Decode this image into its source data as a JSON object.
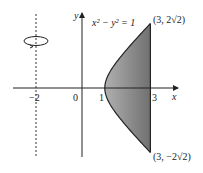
{
  "diagram": {
    "equation_label": "x² − y² = 1",
    "axis_labels": {
      "x": "x",
      "y": "y"
    },
    "ticks": {
      "neg2": "−2",
      "zero": "0",
      "one": "1",
      "three": "3"
    },
    "point_top": "(3, 2√2)",
    "point_bottom": "(3, −2√2)",
    "rotation_axis": "x = −2",
    "region": "between hyperbola x² − y² = 1 and line x = 3",
    "colors": {
      "fill": "#8a8a8a",
      "stroke": "#222222"
    }
  }
}
